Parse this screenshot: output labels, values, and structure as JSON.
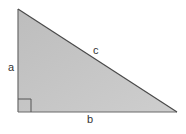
{
  "diagram": {
    "type": "right-triangle",
    "fill_color": "#c6c6c6",
    "stroke_color": "#555555",
    "vertices": {
      "top": [
        18,
        9
      ],
      "right_angle": [
        18,
        112
      ],
      "right": [
        177,
        112
      ]
    },
    "right_angle_marker": {
      "size": 13
    },
    "labels": {
      "a": "a",
      "b": "b",
      "c": "c"
    }
  }
}
